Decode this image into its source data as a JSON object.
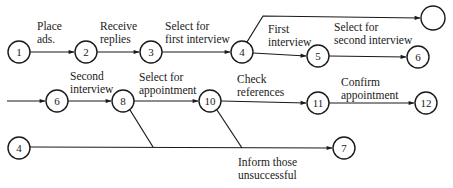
{
  "diagram": {
    "type": "activity-on-arrow network",
    "nodes": [
      {
        "id": "n1",
        "label": "1",
        "x": 19,
        "y": 52,
        "r": 11
      },
      {
        "id": "n2",
        "label": "2",
        "x": 86,
        "y": 52,
        "r": 11
      },
      {
        "id": "n3",
        "label": "3",
        "x": 151,
        "y": 52,
        "r": 11
      },
      {
        "id": "n4",
        "label": "4",
        "x": 242,
        "y": 52,
        "r": 11
      },
      {
        "id": "n5",
        "label": "5",
        "x": 318,
        "y": 56,
        "r": 11
      },
      {
        "id": "n6a",
        "label": "6",
        "x": 418,
        "y": 57,
        "r": 11
      },
      {
        "id": "nEmpty",
        "label": "",
        "x": 433,
        "y": 18,
        "r": 12
      },
      {
        "id": "n6b",
        "label": "6",
        "x": 57,
        "y": 101,
        "r": 11
      },
      {
        "id": "n8",
        "label": "8",
        "x": 123,
        "y": 101,
        "r": 11
      },
      {
        "id": "n10",
        "label": "10",
        "x": 210,
        "y": 101,
        "r": 11
      },
      {
        "id": "n11",
        "label": "11",
        "x": 318,
        "y": 103,
        "r": 11
      },
      {
        "id": "n12",
        "label": "12",
        "x": 426,
        "y": 103,
        "r": 11
      },
      {
        "id": "n4b",
        "label": "4",
        "x": 19,
        "y": 148,
        "r": 11
      },
      {
        "id": "n7",
        "label": "7",
        "x": 344,
        "y": 148,
        "r": 11
      }
    ],
    "edges": [
      {
        "id": "e1",
        "from": "n1",
        "to": "n2",
        "label_lines": [
          "Place",
          "ads."
        ],
        "label_x": 38,
        "label_y": 30
      },
      {
        "id": "e2",
        "from": "n2",
        "to": "n3",
        "label_lines": [
          "Receive",
          "replies"
        ],
        "label_x": 101,
        "label_y": 30
      },
      {
        "id": "e3",
        "from": "n3",
        "to": "n4",
        "label_lines": [
          "Select for",
          "first interview"
        ],
        "label_x": 165,
        "label_y": 30
      },
      {
        "id": "e4",
        "from": "n4",
        "to": "n5",
        "label_lines": [
          "First",
          "interview"
        ],
        "label_x": 268,
        "label_y": 33
      },
      {
        "id": "e5",
        "from": "n5",
        "to": "n6a",
        "label_lines": [
          "Select for",
          "second interview"
        ],
        "label_x": 334,
        "label_y": 31
      },
      {
        "id": "e6",
        "from": "n4",
        "to": "nEmpty",
        "label_lines": [],
        "label_x": 0,
        "label_y": 0
      },
      {
        "id": "e7",
        "from": "n6b",
        "to": "n8",
        "label_lines": [
          "Second",
          "interview"
        ],
        "label_x": 70,
        "label_y": 79
      },
      {
        "id": "e8",
        "from": "n8",
        "to": "n10",
        "label_lines": [
          "Select for",
          "appointment"
        ],
        "label_x": 139,
        "label_y": 80
      },
      {
        "id": "e9",
        "from": "n10",
        "to": "n11",
        "label_lines": [
          "Check",
          "references"
        ],
        "label_x": 237,
        "label_y": 82
      },
      {
        "id": "e10",
        "from": "n11",
        "to": "n12",
        "label_lines": [
          "Confirm",
          "appointment"
        ],
        "label_x": 341,
        "label_y": 85
      },
      {
        "id": "e11",
        "from": "n4b",
        "to": "n7",
        "label_lines": [
          "Inform those",
          "unsuccessful"
        ],
        "label_x": 238,
        "label_y": 164
      },
      {
        "id": "e12",
        "from": "n8",
        "to": "merge",
        "label_lines": [],
        "label_x": 0,
        "label_y": 0
      },
      {
        "id": "e13",
        "from": "n10",
        "to": "merge",
        "label_lines": [],
        "label_x": 0,
        "label_y": 0
      }
    ],
    "incoming_arrow": {
      "to": "n6b",
      "from_x": 20,
      "y": 101
    }
  },
  "text": {
    "place": "Place",
    "ads": "ads.",
    "receive": "Receive",
    "replies": "replies",
    "select_for_1": "Select for",
    "first_interview": "first interview",
    "first": "First",
    "interview_1": "interview",
    "select_for_2": "Select for",
    "second_interview": "second interview",
    "second": "Second",
    "interview_2": "interview",
    "select_for_3": "Select for",
    "appointment_1": "appointment",
    "check": "Check",
    "references": "references",
    "confirm": "Confirm",
    "appointment_2": "appointment",
    "inform_those": "Inform those",
    "unsuccessful": "unsuccessful",
    "node_1": "1",
    "node_2": "2",
    "node_3": "3",
    "node_4": "4",
    "node_5": "5",
    "node_6a": "6",
    "node_empty": "",
    "node_6b": "6",
    "node_8": "8",
    "node_10": "10",
    "node_11": "11",
    "node_12": "12",
    "node_4b": "4",
    "node_7": "7"
  }
}
